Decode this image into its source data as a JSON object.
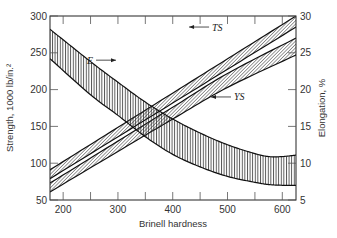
{
  "chart_data": {
    "type": "area",
    "title": "",
    "xlabel": "Brinell hardness",
    "ylabel": "Strength, 1000 lb/in.²",
    "y2label": "Elongation, %",
    "xlim": [
      176,
      625
    ],
    "ylim": [
      50,
      300
    ],
    "y2lim": [
      5,
      30
    ],
    "x_ticks": [
      200,
      300,
      400,
      500,
      600
    ],
    "x_minor_ticks": [
      250,
      350,
      450,
      550
    ],
    "y_ticks": [
      50,
      100,
      150,
      200,
      250,
      300
    ],
    "y2_ticks": [
      5,
      10,
      15,
      20,
      25,
      30
    ],
    "grid": false,
    "legend": null,
    "series": [
      {
        "name": "TS",
        "label": "TS",
        "axis": "left",
        "hatch": "diagonal",
        "x": [
          176,
          625
        ],
        "upper": [
          91,
          300
        ],
        "lower": [
          79,
          285
        ]
      },
      {
        "name": "YS",
        "label": "YS",
        "axis": "left",
        "hatch": "diagonal",
        "x": [
          176,
          300,
          400,
          500,
          625
        ],
        "upper": [
          73,
          130,
          176,
          222,
          270
        ],
        "lower": [
          61,
          116,
          160,
          203,
          247
        ]
      },
      {
        "name": "E",
        "label": "E",
        "axis": "right",
        "hatch": "vertical",
        "x": [
          176,
          250,
          300,
          350,
          400,
          450,
          500,
          550,
          575,
          600,
          625
        ],
        "upper": [
          28.2,
          23.8,
          21.0,
          18.3,
          16.0,
          14.1,
          12.5,
          11.3,
          10.9,
          10.9,
          11.1
        ],
        "lower": [
          24.2,
          19.3,
          16.5,
          13.6,
          11.2,
          9.5,
          8.2,
          7.4,
          7.1,
          7.0,
          7.0
        ]
      }
    ],
    "annotations": [
      {
        "text": "TS",
        "arrow": "left",
        "x": 470,
        "y": 285
      },
      {
        "text": "E",
        "arrow": "right",
        "x": 260,
        "y": 24
      },
      {
        "text": "YS",
        "arrow": "left",
        "x": 510,
        "y": 190
      }
    ]
  }
}
